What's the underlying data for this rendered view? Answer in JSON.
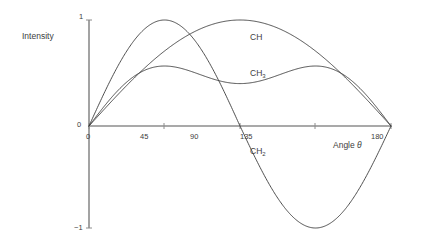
{
  "figure": {
    "background": "#ffffff",
    "curve_color": "#3b3b3b",
    "axis_color": "#8c8c8c",
    "text_color": "#3d3d3d"
  },
  "labels": {
    "y_axis_title": "Intensity",
    "x_axis_title_prefix": "Angle ",
    "x_axis_title_symbol": "θ",
    "y_tick_top": "1",
    "y_tick_zero": "0",
    "y_tick_bottom": "−1",
    "x_tick_0": "0",
    "x_tick_45": "45",
    "x_tick_90": "90",
    "x_tick_135": "135",
    "x_tick_180": "180"
  },
  "series_labels": {
    "ch": "CH",
    "ch3_base": "CH",
    "ch3_sub": "3",
    "ch2_base": "CH",
    "ch2_sub": "2"
  },
  "chart_data": {
    "type": "line",
    "title": "",
    "subtitle": "",
    "xlabel": "Angle θ",
    "ylabel": "Intensity",
    "xlim": [
      0,
      180
    ],
    "ylim": [
      -1,
      1
    ],
    "x_ticks": [
      0,
      45,
      90,
      135,
      180
    ],
    "x_tick_labels": [
      "0",
      "45",
      "90",
      "135",
      "180"
    ],
    "y_ticks": [
      -1,
      0,
      1
    ],
    "y_tick_labels": [
      "−1",
      "0",
      "1"
    ],
    "grid": false,
    "legend": "inline-annotations",
    "legend_position": "inside-plot",
    "annotations": [
      {
        "text": "CH",
        "x": 108,
        "y": 0.8
      },
      {
        "text": "CH3",
        "x": 108,
        "y": 0.45
      },
      {
        "text": "CH2",
        "x": 108,
        "y": -0.2
      }
    ],
    "series": [
      {
        "name": "CH",
        "formula": "sin(theta)",
        "peak_x": 90,
        "peak_y": 1,
        "zeros": [
          0,
          180
        ],
        "x": [
          0,
          10,
          20,
          30,
          40,
          45,
          50,
          60,
          70,
          80,
          90,
          100,
          110,
          120,
          130,
          135,
          140,
          150,
          160,
          170,
          180
        ],
        "values": [
          0,
          0.174,
          0.342,
          0.5,
          0.643,
          0.707,
          0.766,
          0.866,
          0.94,
          0.985,
          1,
          0.985,
          0.94,
          0.866,
          0.766,
          0.707,
          0.643,
          0.5,
          0.342,
          0.174,
          0
        ]
      },
      {
        "name": "CH2",
        "formula": "sin(2*theta)",
        "peak_x": 45,
        "peak_y": 1,
        "min_x": 135,
        "min_y": -1,
        "zeros": [
          0,
          90,
          180
        ],
        "x": [
          0,
          10,
          20,
          30,
          40,
          45,
          50,
          60,
          70,
          80,
          90,
          100,
          110,
          120,
          130,
          135,
          140,
          150,
          160,
          170,
          180
        ],
        "values": [
          0,
          0.342,
          0.643,
          0.866,
          0.985,
          1,
          0.985,
          0.866,
          0.643,
          0.342,
          0,
          -0.342,
          -0.643,
          -0.866,
          -0.985,
          -1,
          -0.985,
          -0.866,
          -0.643,
          -0.342,
          0
        ]
      },
      {
        "name": "CH3",
        "formula": "0.8*(3*sin(theta)+sin(3*theta))/4",
        "peak_x": 40,
        "peak_y": 0.8,
        "second_peak_x": 140,
        "second_peak_y": 0.8,
        "zeros": [
          0,
          90,
          180
        ],
        "x": [
          0,
          10,
          20,
          30,
          40,
          45,
          50,
          60,
          70,
          80,
          90,
          100,
          110,
          120,
          130,
          135,
          140,
          150,
          160,
          170,
          180
        ],
        "values": [
          0,
          0.234,
          0.456,
          0.646,
          0.763,
          0.778,
          0.763,
          0.646,
          0.456,
          0.234,
          0,
          0.234,
          0.456,
          0.646,
          0.763,
          0.778,
          0.763,
          0.646,
          0.456,
          0.234,
          0
        ]
      }
    ]
  }
}
